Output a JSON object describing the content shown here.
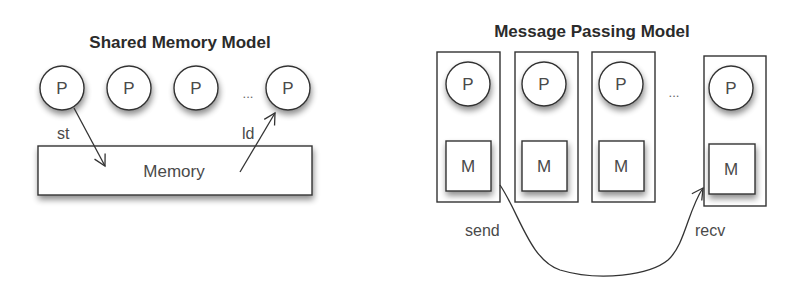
{
  "shared_memory": {
    "title": "Shared Memory Model",
    "processors": [
      {
        "label": "P"
      },
      {
        "label": "P"
      },
      {
        "label": "P"
      },
      {
        "label": "P"
      }
    ],
    "ellipsis": "...",
    "memory_label": "Memory",
    "store_label": "st",
    "load_label": "ld"
  },
  "message_passing": {
    "title": "Message Passing Model",
    "nodes": [
      {
        "processor": "P",
        "memory": "M"
      },
      {
        "processor": "P",
        "memory": "M"
      },
      {
        "processor": "P",
        "memory": "M"
      },
      {
        "processor": "P",
        "memory": "M"
      }
    ],
    "ellipsis": "...",
    "send_label": "send",
    "recv_label": "recv"
  },
  "colors": {
    "stroke": "#333333",
    "text": "#4a4a4a",
    "title": "#2b2b2b",
    "shadow": "#bdbdbd",
    "background": "#ffffff"
  }
}
